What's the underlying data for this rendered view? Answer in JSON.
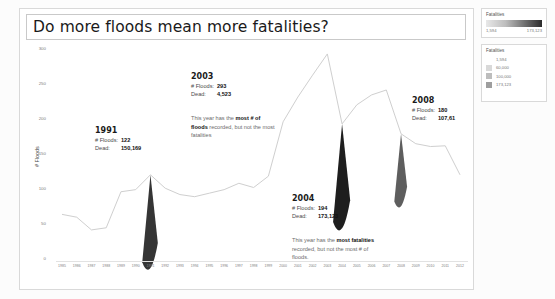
{
  "title": "Do more floods mean more fatalities?",
  "axes": {
    "ylabel": "# Floods",
    "yticks": [
      "300",
      "250",
      "200",
      "150",
      "100",
      "50",
      "0"
    ]
  },
  "annotations": [
    {
      "year": "1991",
      "floods_label": "# Floods:",
      "floods_value": "122",
      "dead_label": "Dead:",
      "dead_value": "150,169"
    },
    {
      "year": "2003",
      "floods_label": "# Floods:",
      "floods_value": "293",
      "dead_label": "Dead:",
      "dead_value": "4,523",
      "note_pre": "This year has the ",
      "note_bold": "most # of floods",
      "note_post": " recorded, but not the most fatalities"
    },
    {
      "year": "2004",
      "floods_label": "# Floods:",
      "floods_value": "194",
      "dead_label": "Dead:",
      "dead_value": "173,123",
      "note_pre": "This year has the ",
      "note_bold": "most fatalities",
      "note_post": " recorded, but not the most # of floods."
    },
    {
      "year": "2008",
      "floods_label": "# Floods:",
      "floods_value": "180",
      "dead_label": "Dead:",
      "dead_value": "107,61"
    }
  ],
  "legends": {
    "gradient": {
      "title": "Fatalities",
      "min": "1,594",
      "max": "173,123"
    },
    "steps": {
      "title": "Fatalities",
      "items": [
        {
          "value": "1,594",
          "color": "#ffffff"
        },
        {
          "value": "60,000",
          "color": "#d9d9d9"
        },
        {
          "value": "100,000",
          "color": "#bdbdbd"
        },
        {
          "value": "173,123",
          "color": "#9e9e9e"
        }
      ]
    }
  },
  "chart_data": {
    "type": "line",
    "title": "Do more floods mean more fatalities?",
    "xlabel": "",
    "ylabel": "# Floods",
    "ylim": [
      0,
      300
    ],
    "grid": false,
    "legend_position": "right",
    "x": [
      "1985",
      "1986",
      "1987",
      "1988",
      "1989",
      "1990",
      "1991",
      "1992",
      "1993",
      "1994",
      "1995",
      "1996",
      "1997",
      "1998",
      "1999",
      "2000",
      "2001",
      "2002",
      "2003",
      "2004",
      "2005",
      "2006",
      "2007",
      "2008",
      "2009",
      "2010",
      "2011",
      "2012"
    ],
    "series": [
      {
        "name": "# Floods",
        "values": [
          66,
          62,
          44,
          47,
          98,
          101,
          122,
          103,
          94,
          91,
          96,
          101,
          110,
          104,
          120,
          197,
          232,
          263,
          293,
          194,
          221,
          235,
          242,
          180,
          166,
          162,
          163,
          122
        ]
      },
      {
        "name": "Fatalities",
        "values": [
          1594,
          2100,
          3000,
          5200,
          4100,
          6000,
          150169,
          5400,
          6200,
          5900,
          6400,
          7200,
          8100,
          7400,
          9200,
          11000,
          12500,
          9800,
          4523,
          173123,
          8200,
          7600,
          9100,
          107610,
          6200,
          5400,
          4900,
          3100
        ]
      }
    ],
    "highlight_years": [
      "1991",
      "2004",
      "2008"
    ]
  }
}
